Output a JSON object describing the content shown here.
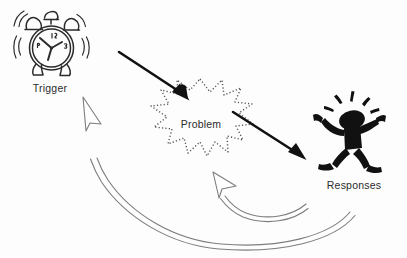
{
  "diagram": {
    "background_color": "#fdfdfd",
    "ink_color": "#1a1a1a",
    "outline_color": "#808080",
    "nodes": [
      {
        "id": "trigger",
        "label": "Trigger",
        "icon": "alarm-clock-icon",
        "position": "top-left",
        "icon_style": "line-drawing ringing alarm clock with two bells, motion lines, clock hands"
      },
      {
        "id": "problem",
        "label": "Problem",
        "icon": "starburst-icon",
        "position": "center",
        "icon_style": "dotted outline explosion starburst"
      },
      {
        "id": "responses",
        "label": "Responses",
        "icon": "distressed-stick-figure-icon",
        "position": "right",
        "icon_style": "solid black stick figure clutching head, motion lines above head"
      }
    ],
    "connectors": [
      {
        "id": "trigger-to-problem",
        "from": "trigger",
        "to": "problem",
        "style": "solid-black-arrow",
        "direction": "down-right"
      },
      {
        "id": "problem-to-responses",
        "from": "problem",
        "to": "responses",
        "style": "solid-black-arrow",
        "direction": "down-right"
      },
      {
        "id": "responses-to-problem-feedback",
        "from": "responses",
        "to": "problem",
        "style": "hollow-curved-arrow",
        "direction": "curved-left-up"
      },
      {
        "id": "responses-to-trigger-feedback",
        "from": "responses",
        "to": "trigger",
        "style": "hollow-curved-arrow",
        "direction": "curved-left-up"
      }
    ]
  },
  "labels": {
    "trigger": "Trigger",
    "problem": "Problem",
    "responses": "Responses"
  }
}
